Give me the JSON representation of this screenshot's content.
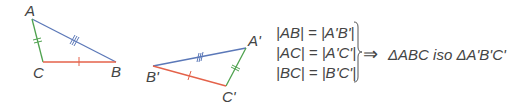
{
  "triangle1": {
    "vertices": {
      "A": "A",
      "B": "B",
      "C": "C"
    },
    "sides": [
      {
        "name": "AB",
        "color": "#5b78b8",
        "ticks": 3
      },
      {
        "name": "AC",
        "color": "#4fa24f",
        "ticks": 2
      },
      {
        "name": "BC",
        "color": "#e4624a",
        "ticks": 1
      }
    ]
  },
  "triangle2": {
    "vertices": {
      "A": "A'",
      "B": "B'",
      "C": "C'"
    },
    "sides": [
      {
        "name": "A'B'",
        "color": "#5b78b8",
        "ticks": 3
      },
      {
        "name": "A'C'",
        "color": "#4fa24f",
        "ticks": 2
      },
      {
        "name": "B'C'",
        "color": "#e4624a",
        "ticks": 1
      }
    ]
  },
  "equations": [
    "|AB| = |A'B'|",
    "|AC| = |A'C'|",
    "|BC| = |B'C'|"
  ],
  "implies_symbol": "⇒",
  "conclusion": "ΔABC iso ΔA'B'C'"
}
